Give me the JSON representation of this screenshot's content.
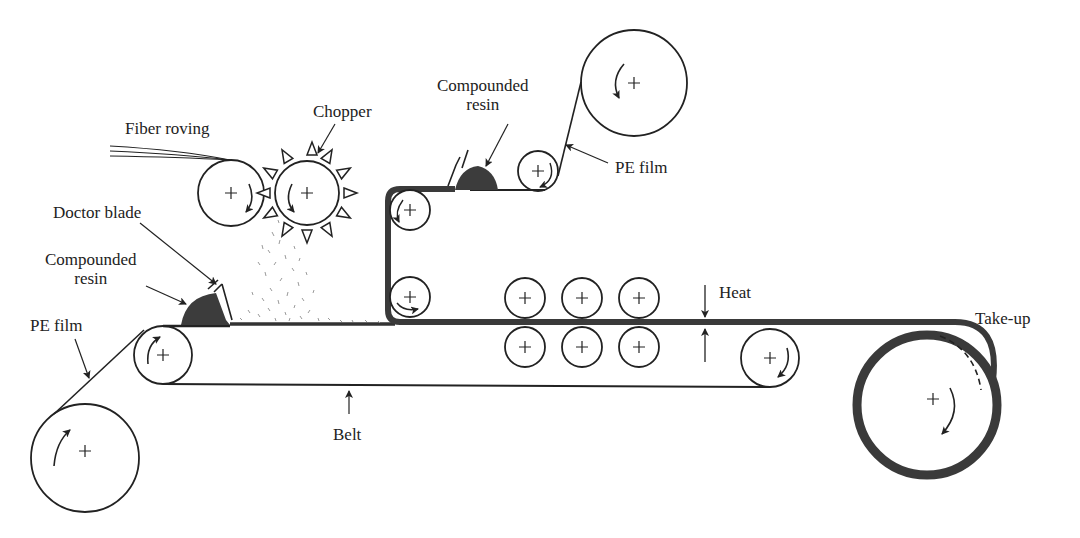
{
  "diagram": {
    "labels": {
      "fiber_roving": "Fiber roving",
      "chopper": "Chopper",
      "doctor_blade": "Doctor blade",
      "compounded_resin_lower_1": "Compounded",
      "compounded_resin_lower_2": "resin",
      "compounded_resin_upper_1": "Compounded",
      "compounded_resin_upper_2": "resin",
      "pe_film_lower": "PE film",
      "pe_film_upper": "PE film",
      "belt": "Belt",
      "heat": "Heat",
      "take_up": "Take-up"
    },
    "colors": {
      "line": "#222222",
      "sheet": "#3a3a3a",
      "resin": "#3c3c3c",
      "fibers": "#9a9a9a"
    },
    "components": [
      {
        "name": "PE film supply roll (lower)",
        "rotation": "counterclockwise"
      },
      {
        "name": "Belt drive roller (left)",
        "rotation": "clockwise"
      },
      {
        "name": "Fiber feed roller",
        "rotation": "clockwise"
      },
      {
        "name": "Chopper wheel",
        "rotation": "counterclockwise"
      },
      {
        "name": "PE film supply roll (upper)",
        "rotation": "counterclockwise"
      },
      {
        "name": "Guide rollers",
        "count": 3
      },
      {
        "name": "Compaction rollers",
        "count": 6
      },
      {
        "name": "Belt drive roller (right)",
        "rotation": "clockwise"
      },
      {
        "name": "Take-up roll",
        "rotation": "clockwise"
      }
    ]
  }
}
